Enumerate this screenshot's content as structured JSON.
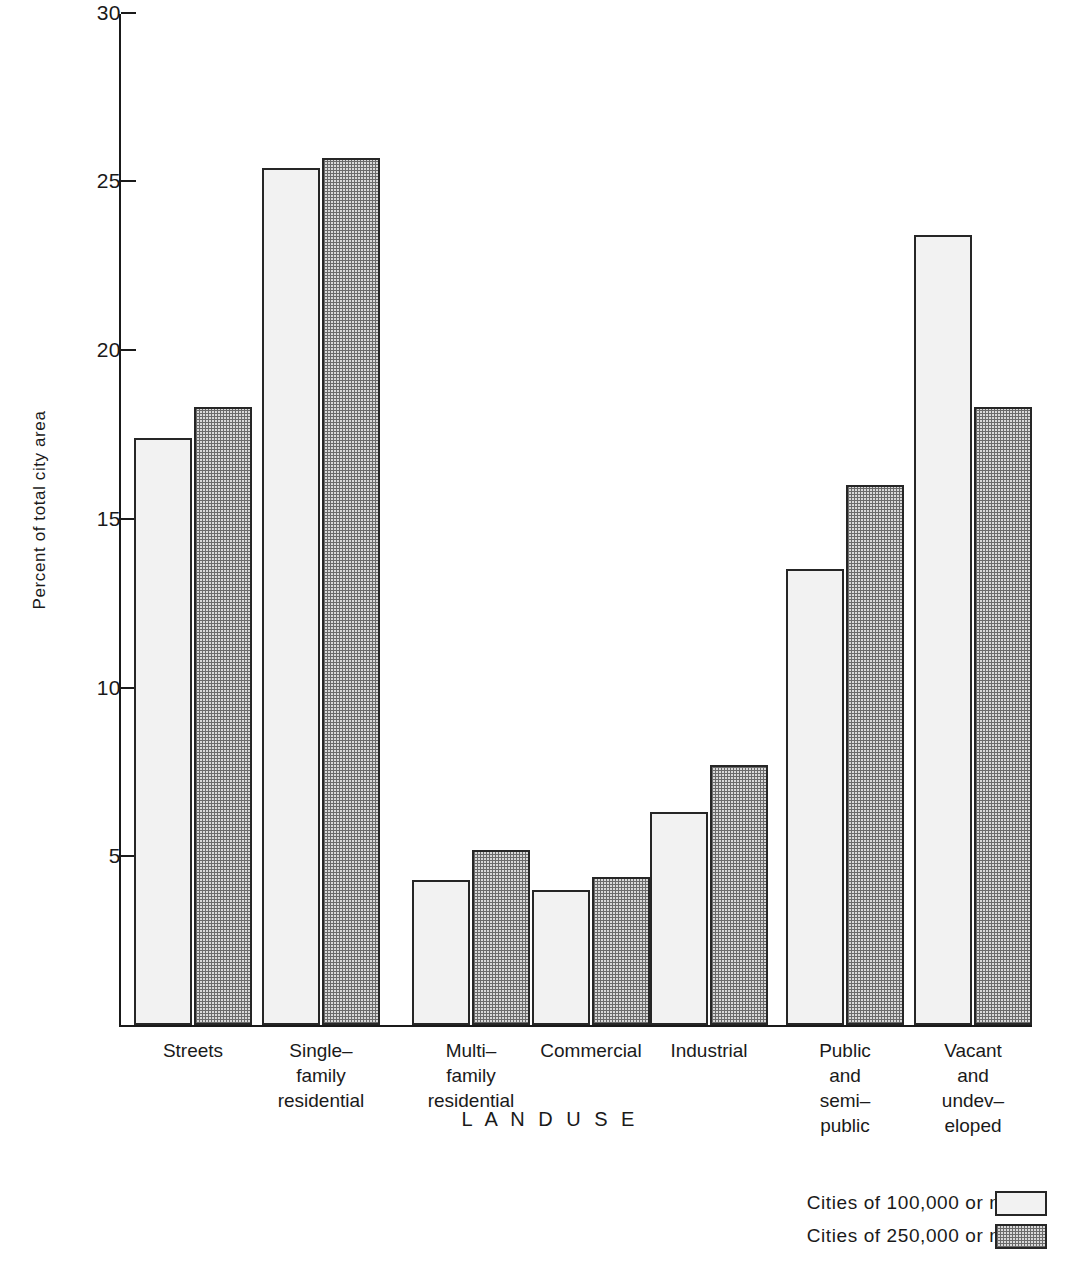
{
  "chart_data": {
    "type": "bar",
    "title": "",
    "xlabel": "L A N D    U S E",
    "ylabel": "Percent of total city area",
    "ylim": [
      0,
      30
    ],
    "yticks": [
      0,
      5,
      10,
      15,
      20,
      25,
      30
    ],
    "ytick_labels": [
      "",
      "5",
      "10",
      "15",
      "20",
      "25",
      "30"
    ],
    "grid": false,
    "legend_position": "bottom-right",
    "categories": [
      "Streets",
      "Single–\nfamily\nresidential",
      "Multi–\nfamily\nresidential",
      "Commercial",
      "Industrial",
      "Public\nand\nsemi–\npublic",
      "Vacant\nand\nundev–\neloped"
    ],
    "series": [
      {
        "name": "Cities of 100,000 or more",
        "fill": "light-stipple",
        "values": [
          17.4,
          25.4,
          4.3,
          4.0,
          6.3,
          13.5,
          23.4
        ]
      },
      {
        "name": "Cities of 250,000 or more",
        "fill": "dark-stipple",
        "values": [
          18.3,
          25.7,
          5.2,
          4.4,
          7.7,
          16.0,
          18.3
        ]
      }
    ]
  },
  "axes": {
    "y_title": "Percent of total city area",
    "x_title": "L A N D    U S E",
    "y_tick_labels": [
      "30",
      "25",
      "20",
      "15",
      "10",
      "5"
    ]
  },
  "legend": {
    "items": [
      {
        "label": "Cities of 100,000 or more",
        "swatch": "light-stipple-swatch"
      },
      {
        "label": "Cities of 250,000 or more",
        "swatch": "dark-stipple-swatch"
      }
    ]
  },
  "categories_display": [
    "Streets",
    "Single–\nfamily\nresidential",
    "Multi–\nfamily\nresidential",
    "Commercial",
    "Industrial",
    "Public\nand\nsemi–\npublic",
    "Vacant\nand\nundev–\neloped"
  ],
  "colors": {
    "axis": "#1a1a1a",
    "bar_outline": "#262626",
    "series_light_fill": "#f2f2f2",
    "series_dark_fill": "#d8d8d8",
    "background": "#ffffff"
  }
}
